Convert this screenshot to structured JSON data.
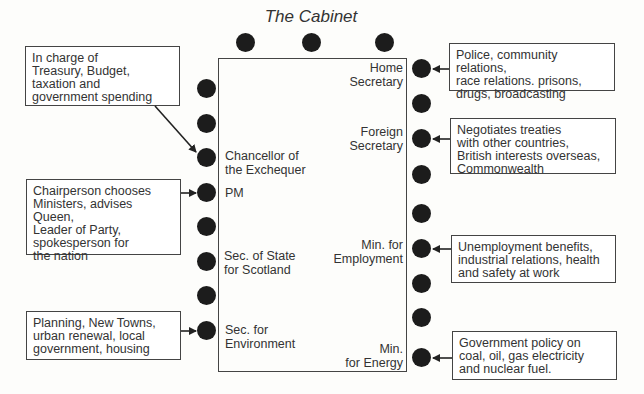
{
  "title": "The Cabinet",
  "roles": {
    "chancellor": "Chancellor of\nthe Exchequer",
    "pm": "PM",
    "scotland": "Sec. of State\nfor Scotland",
    "environment": "Sec. for\nEnvironment",
    "home": "Home\nSecretary",
    "foreign": "Foreign\nSecretary",
    "employment": "Min. for\nEmployment",
    "energy": "Min.\nfor Energy"
  },
  "notes": {
    "chancellor": "In charge of\nTreasury, Budget,\ntaxation and\ngovernment spending",
    "pm": "Chairperson chooses\nMinisters, advises Queen,\nLeader of Party,\nspokesperson for\nthe nation",
    "environment": "Planning, New Towns,\nurban renewal, local\ngovernment, housing",
    "home": "Police, community relations,\nrace relations. prisons,\ndrugs, broadcasting",
    "foreign": "Negotiates treaties\nwith other countries,\nBritish interests overseas,\nCommonwealth",
    "employment": "Unemployment benefits,\nindustrial relations, health\nand safety at work",
    "energy": "Government policy on\ncoal, oil, gas electricity\nand nuclear fuel."
  },
  "seats": {
    "top_count": 3,
    "left_count": 8,
    "right_count": 9
  }
}
